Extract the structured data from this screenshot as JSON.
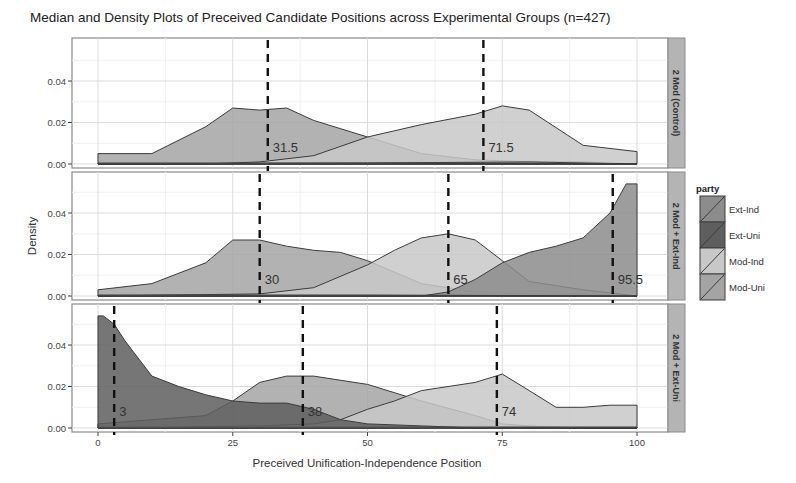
{
  "chart_data": {
    "type": "area",
    "title": "Median and Density Plots of Preceived Candidate Positions across Experimental Groups (n=427)",
    "xlabel": "Preceived Unification-Independence Position",
    "ylabel": "Density",
    "xlim": [
      0,
      100
    ],
    "ylim": [
      0,
      0.055
    ],
    "x_ticks": [
      0,
      25,
      50,
      75,
      100
    ],
    "y_ticks": [
      0.0,
      0.02,
      0.04
    ],
    "y_tick_labels": [
      "0.00",
      "0.02",
      "0.04"
    ],
    "grid": true,
    "legend": {
      "title": "party",
      "position": "right",
      "entries": [
        {
          "label": "Ext-Ind",
          "color": "#8c8c8c"
        },
        {
          "label": "Ext-Uni",
          "color": "#5e5e5e"
        },
        {
          "label": "Mod-Ind",
          "color": "#c8c8c8"
        },
        {
          "label": "Mod-Uni",
          "color": "#a4a4a4"
        }
      ]
    },
    "panels": [
      {
        "strip": "2 Mod (Control)",
        "medians": [
          {
            "party": "Mod-Uni",
            "value": 31.5,
            "label": "31.5"
          },
          {
            "party": "Mod-Ind",
            "value": 71.5,
            "label": "71.5"
          }
        ],
        "series": [
          {
            "name": "Mod-Uni",
            "x": [
              0,
              10,
              20,
              25,
              30,
              35,
              40,
              50,
              60,
              70,
              80,
              90,
              100
            ],
            "y": [
              0.005,
              0.005,
              0.018,
              0.027,
              0.026,
              0.027,
              0.021,
              0.013,
              0.005,
              0.002,
              0.001,
              0.001,
              0.0
            ]
          },
          {
            "name": "Mod-Ind",
            "x": [
              0,
              20,
              30,
              40,
              50,
              60,
              70,
              75,
              80,
              90,
              100
            ],
            "y": [
              0.0,
              0.0,
              0.001,
              0.004,
              0.013,
              0.019,
              0.024,
              0.028,
              0.026,
              0.009,
              0.006
            ]
          },
          {
            "name": "Ext-Ind",
            "x": [
              0,
              50,
              80,
              100
            ],
            "y": [
              0.0,
              0.0005,
              0.001,
              0.0
            ]
          },
          {
            "name": "Ext-Uni",
            "x": [
              0,
              50,
              100
            ],
            "y": [
              0.0005,
              0.0005,
              0.0
            ]
          }
        ]
      },
      {
        "strip": "2 Mod + Ext-Ind",
        "medians": [
          {
            "party": "Mod-Uni",
            "value": 30,
            "label": "30"
          },
          {
            "party": "Mod-Ind",
            "value": 65,
            "label": "65"
          },
          {
            "party": "Ext-Ind",
            "value": 95.5,
            "label": "95.5"
          }
        ],
        "series": [
          {
            "name": "Mod-Uni",
            "x": [
              0,
              10,
              20,
              25,
              30,
              35,
              40,
              45,
              50,
              60,
              70,
              80,
              90,
              100
            ],
            "y": [
              0.003,
              0.006,
              0.016,
              0.027,
              0.027,
              0.024,
              0.022,
              0.021,
              0.017,
              0.006,
              0.002,
              0.001,
              0.001,
              0.0
            ]
          },
          {
            "name": "Mod-Ind",
            "x": [
              0,
              30,
              40,
              50,
              55,
              60,
              65,
              70,
              75,
              80,
              90,
              100
            ],
            "y": [
              0.0,
              0.001,
              0.004,
              0.015,
              0.022,
              0.028,
              0.03,
              0.027,
              0.017,
              0.007,
              0.003,
              0.0
            ]
          },
          {
            "name": "Ext-Ind",
            "x": [
              0,
              60,
              65,
              70,
              75,
              80,
              85,
              90,
              95,
              98,
              100
            ],
            "y": [
              0.0,
              0.0,
              0.002,
              0.008,
              0.016,
              0.021,
              0.024,
              0.028,
              0.04,
              0.054,
              0.054
            ]
          },
          {
            "name": "Ext-Uni",
            "x": [
              0,
              50,
              100
            ],
            "y": [
              0.0005,
              0.0005,
              0.0
            ]
          }
        ]
      },
      {
        "strip": "2 Mod + Ext-Uni",
        "medians": [
          {
            "party": "Ext-Uni",
            "value": 3,
            "label": "3"
          },
          {
            "party": "Mod-Uni",
            "value": 38,
            "label": "38"
          },
          {
            "party": "Mod-Ind",
            "value": 74,
            "label": "74"
          }
        ],
        "series": [
          {
            "name": "Ext-Uni",
            "x": [
              0,
              1,
              3,
              5,
              10,
              15,
              20,
              25,
              30,
              35,
              40,
              45,
              50,
              60,
              70,
              100
            ],
            "y": [
              0.054,
              0.054,
              0.05,
              0.042,
              0.025,
              0.02,
              0.016,
              0.013,
              0.012,
              0.012,
              0.009,
              0.004,
              0.002,
              0.001,
              0.0,
              0.0
            ]
          },
          {
            "name": "Mod-Uni",
            "x": [
              0,
              10,
              20,
              25,
              30,
              35,
              40,
              50,
              60,
              70,
              75,
              80,
              90,
              100
            ],
            "y": [
              0.002,
              0.004,
              0.006,
              0.013,
              0.022,
              0.025,
              0.025,
              0.021,
              0.013,
              0.006,
              0.002,
              0.001,
              0.0,
              0.0
            ]
          },
          {
            "name": "Mod-Ind",
            "x": [
              0,
              30,
              40,
              45,
              50,
              55,
              60,
              70,
              75,
              80,
              85,
              90,
              95,
              100
            ],
            "y": [
              0.0,
              0.001,
              0.002,
              0.004,
              0.009,
              0.013,
              0.018,
              0.022,
              0.026,
              0.018,
              0.01,
              0.01,
              0.011,
              0.011
            ]
          },
          {
            "name": "Ext-Ind",
            "x": [
              0,
              50,
              100
            ],
            "y": [
              0.0005,
              0.0005,
              0.0005
            ]
          }
        ]
      }
    ]
  },
  "labels": {
    "title": "Median and Density Plots of Preceived Candidate Positions across Experimental Groups (n=427)",
    "xlabel": "Preceived Unification-Independence Position",
    "ylabel": "Density",
    "legend_title": "party"
  }
}
